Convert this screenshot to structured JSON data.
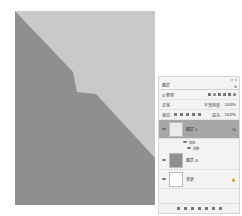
{
  "canvas": {
    "bg_light": "#c9c9c9",
    "bg_dark": "#8f8f8f",
    "shape_points": "0,0 58,61 62,81 81,83 140,147 140,194 0,194"
  },
  "panel": {
    "tab_label": "图层",
    "filter_label": "Q 类型",
    "blend_mode": "正常",
    "opacity_label": "不透明度:",
    "opacity_value": "100%",
    "lock_label": "锁定:",
    "fill_label": "填充:",
    "fill_value": "100%",
    "layers": [
      {
        "name": "图层 1",
        "selected": true,
        "fx": "fx"
      },
      {
        "name": "图层 A",
        "selected": false
      },
      {
        "name": "背景",
        "selected": false,
        "locked": true
      }
    ],
    "effects_label": "效果",
    "effect_item": "投影"
  },
  "colors": {
    "selected_row": "#a6a6a6",
    "layer_thumb_dark": "#8f8f8f"
  }
}
